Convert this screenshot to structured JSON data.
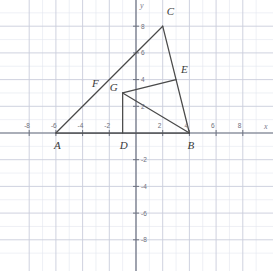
{
  "figure": {
    "kind": "coordinate-plane-geometry",
    "background": "#ffffff",
    "grid_minor_color": "#e3e6ef",
    "grid_major_color": "#c9cddb",
    "axis_color": "#6f7482",
    "shape_color": "#4a4a4a"
  },
  "axes": {
    "x_label": "x",
    "y_label": "y",
    "xlim": [
      -8.7,
      9.3
    ],
    "ylim": [
      -9.2,
      9.4
    ],
    "x_ticks": [
      -8,
      -6,
      -4,
      -2,
      2,
      4,
      6,
      8
    ],
    "y_ticks": [
      8,
      6,
      4,
      2,
      -2,
      -4,
      -6,
      -8
    ],
    "x_tick_labels": [
      "-8",
      "-6",
      "-4",
      "-2",
      "2",
      "4",
      "6",
      "8"
    ],
    "y_tick_labels": [
      "8",
      "6",
      "4",
      "2",
      "-2",
      "-4",
      "-6",
      "-8"
    ],
    "minor_step": 1,
    "major_step": 2,
    "origin_px": [
      136,
      133
    ],
    "px_per_unit": 13.35
  },
  "chart_data": {
    "type": "scatter",
    "title": "",
    "xlabel": "x",
    "ylabel": "y",
    "xlim": [
      -8.7,
      9.3
    ],
    "ylim": [
      -9.2,
      9.4
    ],
    "grid": true,
    "legend": "none",
    "points": [
      {
        "name": "A",
        "x": -6,
        "y": 0,
        "label": "A",
        "label_dx": -2,
        "label_dy": 13
      },
      {
        "name": "B",
        "x": 4,
        "y": 0,
        "label": "B",
        "label_dx": -2,
        "label_dy": 13
      },
      {
        "name": "C",
        "x": 2,
        "y": 8,
        "label": "C",
        "label_dx": 4,
        "label_dy": -14
      },
      {
        "name": "D",
        "x": -1,
        "y": 0,
        "label": "D",
        "label_dx": -3,
        "label_dy": 13
      },
      {
        "name": "E",
        "x": 3,
        "y": 4,
        "label": "E",
        "label_dx": 5,
        "label_dy": -10
      },
      {
        "name": "G",
        "x": -1,
        "y": 3,
        "label": "G",
        "label_dx": -13,
        "label_dy": -5
      }
    ],
    "segments": [
      {
        "name": "AB",
        "from": "A",
        "to": "B"
      },
      {
        "name": "AC",
        "from": "A",
        "to": "C"
      },
      {
        "name": "CB",
        "from": "C",
        "to": "B"
      },
      {
        "name": "DG",
        "from": "D",
        "to": "G"
      },
      {
        "name": "GE",
        "from": "G",
        "to": "E"
      },
      {
        "name": "GB",
        "from": "G",
        "to": "B"
      }
    ],
    "segment_labels": [
      {
        "name": "F",
        "label": "F",
        "x": -3.3,
        "y": 4.1
      }
    ]
  }
}
